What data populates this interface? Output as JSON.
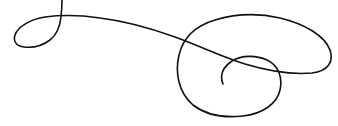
{
  "image": {
    "description": "Decorative calligraphic flourish line drawing",
    "background_color": "#ffffff",
    "stroke_color": "#111111"
  }
}
